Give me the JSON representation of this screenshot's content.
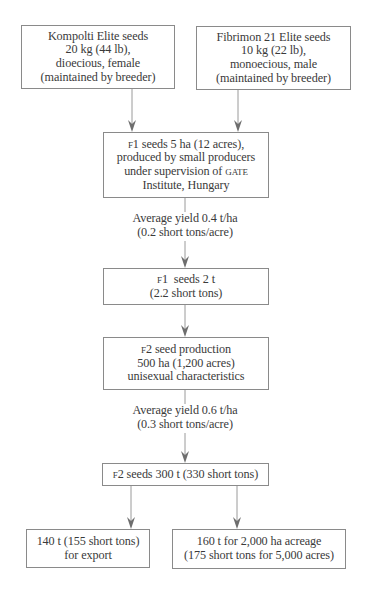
{
  "diagram": {
    "type": "flowchart",
    "nodes": {
      "kompolti": {
        "lines": [
          "Kompolti Elite seeds",
          "20 kg (44 lb),",
          "dioecious, female",
          "(maintained by breeder)"
        ]
      },
      "fibrimon": {
        "lines": [
          "Fibrimon 21 Elite seeds",
          "10 kg (22 lb),",
          "monoecious, male",
          "(maintained by breeder)"
        ]
      },
      "f1_production": {
        "prefix": "F1",
        "lines": [
          " seeds 5 ha (12 acres),",
          "produced by small producers",
          "under supervision of ",
          "Institute, Hungary"
        ],
        "acronym": "GATE"
      },
      "yield_1": {
        "lines": [
          "Average yield 0.4 t/ha",
          "(0.2 short tons/acre)"
        ]
      },
      "f1_seeds": {
        "prefix": "F1",
        "lines": [
          "  seeds 2 t",
          "(2.2 short tons)"
        ]
      },
      "f2_production": {
        "prefix": "F2",
        "lines": [
          " seed production",
          "500 ha (1,200 acres)",
          "unisexual characteristics"
        ]
      },
      "yield_2": {
        "lines": [
          "Average yield 0.6 t/ha",
          "(0.3 short tons/acre)"
        ]
      },
      "f2_seeds": {
        "prefix": "F2",
        "lines": [
          " seeds 300 t (330 short tons)"
        ]
      },
      "export": {
        "lines": [
          "140 t (155 short tons)",
          "for export"
        ]
      },
      "acreage": {
        "lines": [
          "160 t for 2,000 ha acreage",
          "(175 short tons for 5,000 acres)"
        ]
      }
    },
    "edges": [
      {
        "from": "kompolti",
        "to": "f1_production"
      },
      {
        "from": "fibrimon",
        "to": "f1_production"
      },
      {
        "from": "f1_production",
        "to": "f1_seeds",
        "label": "yield_1"
      },
      {
        "from": "f1_seeds",
        "to": "f2_production"
      },
      {
        "from": "f2_production",
        "to": "f2_seeds",
        "label": "yield_2"
      },
      {
        "from": "f2_seeds",
        "to": "export"
      },
      {
        "from": "f2_seeds",
        "to": "acreage"
      }
    ],
    "colors": {
      "line": "#8a8a8a",
      "arrowhead": "#6e6e6e",
      "text": "#3a3a3a",
      "background": "#ffffff"
    }
  }
}
